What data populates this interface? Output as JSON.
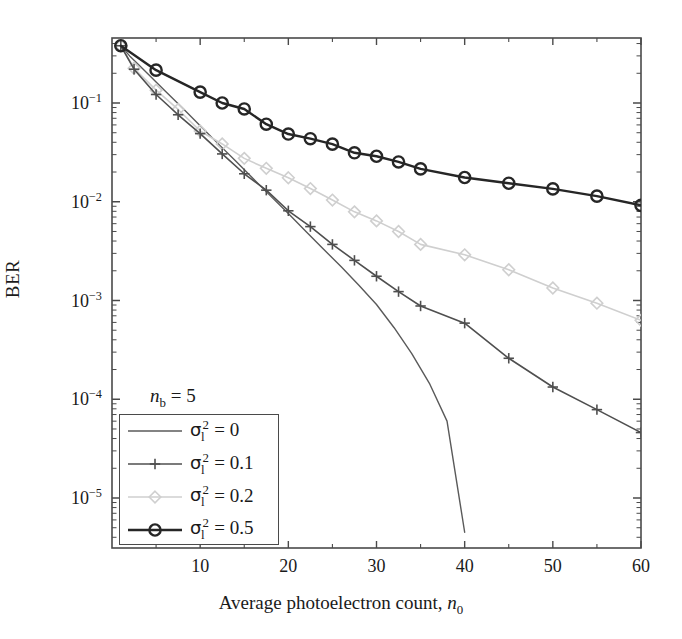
{
  "chart_data": {
    "type": "line",
    "title": "",
    "xlabel": "Average photoelectron count, n0",
    "ylabel": "BER",
    "xlim": [
      0,
      60
    ],
    "ylim": [
      3.3e-06,
      0.55
    ],
    "yscale": "log",
    "grid": false,
    "legend_position": "lower-left",
    "xticks": [
      10,
      20,
      30,
      40,
      50,
      60
    ],
    "xtick_labels": [
      "10",
      "20",
      "30",
      "40",
      "50",
      "60"
    ],
    "yticks": [
      0.1,
      0.01,
      0.001,
      0.0001,
      1e-05
    ],
    "ytick_labels": [
      "10-1",
      "10-2",
      "10-3",
      "10-4",
      "10-5"
    ],
    "annotations": [
      {
        "text": "nb = 5",
        "x": 12,
        "y": 7.5e-05
      }
    ],
    "series": [
      {
        "name": "sigma_l^2 = 0",
        "label": "= 0",
        "color": "#5a5a5a",
        "marker": "none",
        "linewidth": 1.4,
        "x": [
          1,
          2,
          3,
          4,
          5,
          6,
          8,
          10,
          12,
          14,
          16,
          18,
          20,
          22,
          24,
          26,
          28,
          30,
          32,
          34,
          36,
          38,
          40
        ],
        "y": [
          0.38,
          0.3,
          0.245,
          0.2,
          0.163,
          0.133,
          0.089,
          0.059,
          0.039,
          0.026,
          0.0172,
          0.0114,
          0.0076,
          0.005,
          0.0033,
          0.0022,
          0.00143,
          0.00091,
          0.00053,
          0.00029,
          0.000145,
          6e-05,
          4.5e-06
        ]
      },
      {
        "name": "sigma_l^2 = 0.1",
        "label": "= 0.1",
        "color": "#4f4f4f",
        "marker": "plus",
        "linewidth": 1.6,
        "x": [
          1,
          2.5,
          5,
          7.5,
          10,
          12.5,
          15,
          17.5,
          20,
          22.5,
          25,
          27.5,
          30,
          32.5,
          35,
          40,
          45,
          50,
          55,
          60
        ],
        "y": [
          0.38,
          0.22,
          0.122,
          0.076,
          0.049,
          0.0305,
          0.0192,
          0.0131,
          0.0081,
          0.0056,
          0.0037,
          0.00255,
          0.00176,
          0.00123,
          0.00088,
          0.00059,
          0.00026,
          0.000133,
          7.85e-05,
          4.6e-05
        ]
      },
      {
        "name": "sigma_l^2 = 0.2",
        "label": "= 0.2",
        "color": "#cfcfcf",
        "marker": "diamond",
        "linewidth": 1.6,
        "x": [
          1,
          2.5,
          5,
          7.5,
          10,
          12.5,
          15,
          17.5,
          20,
          22.5,
          25,
          27.5,
          30,
          32.5,
          35,
          40,
          45,
          50,
          55,
          60
        ],
        "y": [
          0.38,
          0.225,
          0.135,
          0.086,
          0.052,
          0.0385,
          0.0275,
          0.0218,
          0.0175,
          0.0136,
          0.0104,
          0.0079,
          0.0064,
          0.005,
          0.0037,
          0.0029,
          0.00205,
          0.00134,
          0.00094,
          0.00063
        ]
      },
      {
        "name": "sigma_l^2 = 0.5",
        "label": "= 0.5",
        "color": "#262626",
        "marker": "circle",
        "linewidth": 2.4,
        "x": [
          1,
          5,
          10,
          12.5,
          15,
          17.5,
          20,
          22.5,
          25,
          27.5,
          30,
          32.5,
          35,
          40,
          45,
          50,
          55,
          60
        ],
        "y": [
          0.38,
          0.215,
          0.129,
          0.1,
          0.087,
          0.061,
          0.0485,
          0.0435,
          0.0383,
          0.0313,
          0.0289,
          0.0253,
          0.0215,
          0.0176,
          0.0154,
          0.0135,
          0.0114,
          0.0092
        ]
      }
    ]
  },
  "axes": {
    "ylabel_text": "BER",
    "xlabel_prefix": "Average photoelectron count, ",
    "xlabel_var": "n",
    "xlabel_sub": "0"
  },
  "annotation": {
    "var": "n",
    "sub": "b",
    "eq": " = 5"
  },
  "legend": {
    "items": [
      {
        "sigma": "σ",
        "sup": "2",
        "sub": "l",
        "value": "= 0",
        "marker": "none"
      },
      {
        "sigma": "σ",
        "sup": "2",
        "sub": "l",
        "value": "= 0.1",
        "marker": "plus"
      },
      {
        "sigma": "σ",
        "sup": "2",
        "sub": "l",
        "value": "= 0.2",
        "marker": "diamond"
      },
      {
        "sigma": "σ",
        "sup": "2",
        "sub": "l",
        "value": "= 0.5",
        "marker": "circle"
      }
    ]
  },
  "colors": {
    "axis": "#4a4a4a",
    "series0": "#5a5a5a",
    "series1": "#4f4f4f",
    "series2": "#cfcfcf",
    "series3": "#262626"
  }
}
